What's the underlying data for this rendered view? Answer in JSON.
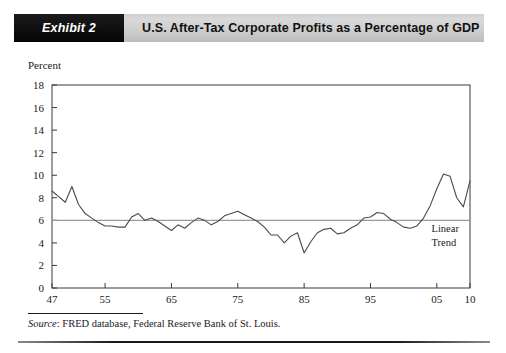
{
  "header": {
    "exhibit_tag": "Exhibit 2",
    "title": "U.S. After-Tax Corporate Profits as a Percentage of GDP",
    "tag_bg": "#111111",
    "bar_bg": "#cfcfcf",
    "title_color": "#111111"
  },
  "axis": {
    "y_label": "Percent"
  },
  "source": {
    "label": "Source",
    "separator": ": ",
    "text": "FRED database, Federal Reserve Bank of St. Louis."
  },
  "chart_data": {
    "type": "line",
    "title": "U.S. After-Tax Corporate Profits as a Percentage of GDP",
    "xlabel": "",
    "ylabel": "Percent",
    "ylim": [
      0,
      18
    ],
    "xlim": [
      1947,
      2010
    ],
    "ytick_values": [
      0,
      2,
      4,
      6,
      8,
      10,
      12,
      14,
      16,
      18
    ],
    "ytick_labels": [
      "0",
      "2",
      "4",
      "6",
      "8",
      "10",
      "12",
      "14",
      "16",
      "18"
    ],
    "xtick_values": [
      1947,
      1955,
      1965,
      1975,
      1985,
      1995,
      2005,
      2010
    ],
    "xtick_labels": [
      "47",
      "55",
      "65",
      "75",
      "85",
      "95",
      "05",
      "10"
    ],
    "grid": false,
    "legend": "none",
    "line_color": "#4a4a4a",
    "trend_color": "#9a9a9a",
    "annotations": [
      {
        "name": "linear-trend-label",
        "text_line1": "Linear",
        "text_line2": "Trend",
        "x": 2004.2,
        "y": 5.0
      }
    ],
    "series": [
      {
        "name": "After-Tax Corporate Profits (% of GDP)",
        "x": [
          1947,
          1948,
          1949,
          1950,
          1951,
          1952,
          1953,
          1954,
          1955,
          1956,
          1957,
          1958,
          1959,
          1960,
          1961,
          1962,
          1963,
          1964,
          1965,
          1966,
          1967,
          1968,
          1969,
          1970,
          1971,
          1972,
          1973,
          1974,
          1975,
          1976,
          1977,
          1978,
          1979,
          1980,
          1981,
          1982,
          1983,
          1984,
          1985,
          1986,
          1987,
          1988,
          1989,
          1990,
          1991,
          1992,
          1993,
          1994,
          1995,
          1996,
          1997,
          1998,
          1999,
          2000,
          2001,
          2002,
          2003,
          2004,
          2005,
          2006,
          2007,
          2008,
          2009,
          2010
        ],
        "y": [
          8.6,
          8.1,
          7.6,
          9.0,
          7.4,
          6.6,
          6.2,
          5.8,
          5.5,
          5.5,
          5.4,
          5.4,
          6.3,
          6.6,
          6.0,
          6.2,
          5.9,
          5.5,
          5.1,
          5.6,
          5.3,
          5.8,
          6.2,
          6.0,
          5.6,
          5.9,
          6.4,
          6.6,
          6.8,
          6.5,
          6.2,
          5.9,
          5.4,
          4.7,
          4.7,
          4.0,
          4.6,
          4.9,
          3.1,
          4.1,
          4.9,
          5.2,
          5.3,
          4.8,
          4.9,
          5.3,
          5.6,
          6.2,
          6.3,
          6.7,
          6.6,
          6.1,
          5.8,
          5.4,
          5.3,
          5.5,
          6.2,
          7.3,
          8.8,
          10.1,
          9.9,
          8.0,
          7.2,
          9.5
        ]
      }
    ],
    "trend_line": {
      "name": "Linear Trend",
      "y_value": 6.0,
      "x_start": 1947,
      "x_end": 2010
    }
  }
}
